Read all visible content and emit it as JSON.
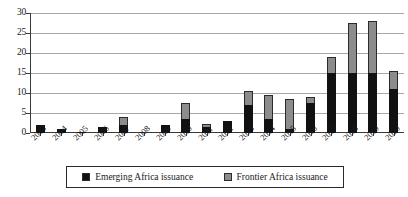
{
  "chart_data": {
    "type": "bar",
    "subtype": "stacked-bar",
    "title": "",
    "subtitle": "",
    "xlabel": "",
    "ylabel": "",
    "ylim": [
      0,
      30
    ],
    "yticks": [
      0,
      5,
      10,
      15,
      20,
      25,
      30
    ],
    "ytick_labels": [
      "0",
      "5",
      "10",
      "15",
      "20",
      "25",
      "30"
    ],
    "grid": true,
    "grid_axis": "y",
    "legend_position": "bottom",
    "categories": [
      "2003",
      "2004",
      "2005",
      "2006",
      "2007",
      "2008",
      "2009",
      "2010",
      "2011",
      "2012",
      "2013",
      "2014",
      "2015",
      "2016",
      "2017",
      "2018",
      "2019",
      "2020"
    ],
    "series": [
      {
        "name": "Emerging Africa issuance",
        "color": "#111111",
        "values": [
          2.0,
          1.0,
          0.2,
          1.5,
          2.0,
          0,
          2.0,
          3.5,
          1.5,
          3.0,
          7.0,
          3.5,
          1.0,
          7.5,
          15.0,
          15.0,
          15.0,
          11.0
        ]
      },
      {
        "name": "Frontier Africa issuance",
        "color": "#8c8c8c",
        "values": [
          0,
          0,
          0,
          0,
          2.0,
          0,
          0,
          4.0,
          0.7,
          0,
          3.5,
          6.0,
          7.5,
          1.5,
          4.0,
          12.5,
          13.0,
          4.5
        ]
      }
    ],
    "totals": [
      2.0,
      1.0,
      0.2,
      1.5,
      4.0,
      0,
      2.0,
      7.5,
      2.2,
      3.0,
      10.5,
      9.5,
      8.5,
      9.0,
      19.0,
      27.5,
      28.0,
      15.5
    ]
  },
  "legend": {
    "entries": [
      {
        "label": "Emerging Africa issuance",
        "swatch": "emerging"
      },
      {
        "label": "Frontier Africa issuance",
        "swatch": "frontier"
      }
    ]
  },
  "colors": {
    "emerging": "#111111",
    "frontier": "#8c8c8c",
    "gridline": "#a8a8a8",
    "axis": "#3a3a3a",
    "background": "#ffffff"
  }
}
